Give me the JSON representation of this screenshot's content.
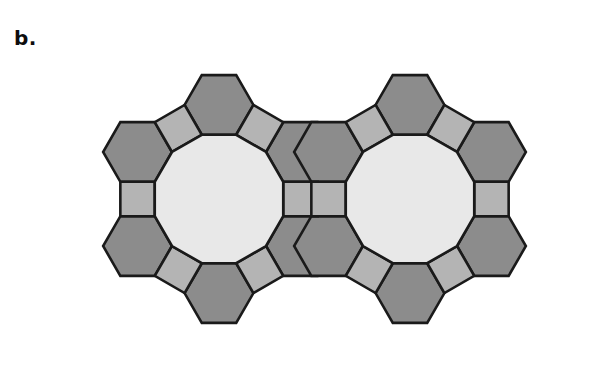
{
  "figure": {
    "panel_label": "b.",
    "caption_label_name": "panel-b",
    "tiling_name": "4.6.12 truncated hexagonal tiling",
    "background_color": "#ffffff",
    "stroke_color": "#1a1a1a",
    "stroke_width": 2.6,
    "colors": {
      "dodecagon_fill": "#e8e8e8",
      "hexagon_fill": "#8c8c8c",
      "square_fill": "#b4b4b4"
    },
    "geometry": {
      "canvas_width": 590,
      "canvas_height": 367,
      "dodecagon_circumradius": 66.5,
      "dodecagon_centers": [
        {
          "x": 219,
          "y": 199
        },
        {
          "x": 410,
          "y": 199
        }
      ],
      "ring_tiles": [
        {
          "index": 0,
          "shape": "square",
          "angle_deg": 0
        },
        {
          "index": 1,
          "shape": "hexagon",
          "angle_deg": 30
        },
        {
          "index": 2,
          "shape": "square",
          "angle_deg": 60
        },
        {
          "index": 3,
          "shape": "hexagon",
          "angle_deg": 90
        },
        {
          "index": 4,
          "shape": "square",
          "angle_deg": 120
        },
        {
          "index": 5,
          "shape": "hexagon",
          "angle_deg": 150
        },
        {
          "index": 6,
          "shape": "square",
          "angle_deg": 180
        },
        {
          "index": 7,
          "shape": "hexagon",
          "angle_deg": 210
        },
        {
          "index": 8,
          "shape": "square",
          "angle_deg": 240
        },
        {
          "index": 9,
          "shape": "hexagon",
          "angle_deg": 270
        },
        {
          "index": 10,
          "shape": "square",
          "angle_deg": 300
        },
        {
          "index": 11,
          "shape": "hexagon",
          "angle_deg": 330
        }
      ],
      "shape_sides": {
        "dodecagon": 12,
        "hexagon": 6,
        "square": 4
      },
      "vertex_configuration": "4.6.12",
      "notes": "Each dodecagon edge is shared with either a square or a hexagon, alternating around the ring; the two dodecagon rings share one central square and two hexagons."
    }
  }
}
